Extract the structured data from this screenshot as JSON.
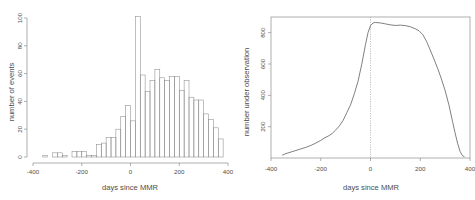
{
  "figure": {
    "width": 475,
    "height": 200,
    "background": "#ffffff",
    "axis_color": "#8c8c8c",
    "text_color": "#4d4d4d",
    "curve_color": "#555555"
  },
  "chart_data": [
    {
      "type": "bar",
      "name": "histogram-events",
      "title": "",
      "xlabel": "days since MMR",
      "ylabel": "number of events",
      "xlim": [
        -400,
        400
      ],
      "ylim": [
        0,
        100
      ],
      "xticks": [
        -400,
        -200,
        0,
        200,
        400
      ],
      "xticklabels": [
        "-400",
        "-200",
        "0",
        "200",
        "400"
      ],
      "yticks": [
        0,
        20,
        40,
        60,
        80,
        100
      ],
      "yticklabels": [
        "0",
        "20",
        "40",
        "60",
        "80",
        "100"
      ],
      "grid": false,
      "legend": null,
      "bin_width": 20,
      "bin_starts": [
        -380,
        -360,
        -340,
        -320,
        -300,
        -280,
        -260,
        -240,
        -220,
        -200,
        -180,
        -160,
        -140,
        -120,
        -100,
        -80,
        -60,
        -40,
        -20,
        0,
        20,
        40,
        60,
        80,
        100,
        120,
        140,
        160,
        180,
        200,
        220,
        240,
        260,
        280,
        300,
        320,
        340,
        360
      ],
      "values": [
        0,
        1,
        0,
        3,
        3,
        1,
        0,
        4,
        4,
        4,
        1,
        1,
        9,
        10,
        14,
        14,
        20,
        29,
        37,
        26,
        101,
        59,
        47,
        55,
        63,
        57,
        55,
        58,
        58,
        48,
        55,
        43,
        41,
        41,
        31,
        27,
        21,
        13
      ]
    },
    {
      "type": "line",
      "name": "number-under-observation",
      "title": "",
      "xlabel": "days since MMR",
      "ylabel": "number under observation",
      "xlim": [
        -400,
        400
      ],
      "ylim": [
        0,
        900
      ],
      "xticks": [
        -400,
        -200,
        0,
        200,
        400
      ],
      "xticklabels": [
        "-400",
        "-200",
        "0",
        "200",
        "400"
      ],
      "yticks": [
        200,
        400,
        600,
        800
      ],
      "yticklabels": [
        "200",
        "400",
        "600",
        "800"
      ],
      "grid": false,
      "legend": null,
      "annotations": [
        {
          "type": "vline",
          "x": 0,
          "style": "dotted"
        }
      ],
      "x": [
        -355,
        -340,
        -320,
        -300,
        -280,
        -260,
        -240,
        -220,
        -200,
        -185,
        -170,
        -155,
        -140,
        -125,
        -110,
        -95,
        -80,
        -65,
        -50,
        -35,
        -20,
        -10,
        0,
        10,
        20,
        40,
        60,
        80,
        100,
        120,
        140,
        160,
        180,
        195,
        210,
        225,
        240,
        255,
        270,
        285,
        300,
        315,
        330,
        340,
        350,
        360,
        370,
        378
      ],
      "y": [
        18,
        28,
        38,
        48,
        58,
        68,
        80,
        95,
        112,
        128,
        140,
        155,
        178,
        205,
        240,
        290,
        340,
        410,
        490,
        600,
        725,
        800,
        845,
        862,
        865,
        862,
        856,
        850,
        846,
        848,
        845,
        838,
        825,
        812,
        788,
        745,
        690,
        632,
        572,
        505,
        430,
        340,
        232,
        160,
        95,
        42,
        14,
        8
      ]
    }
  ]
}
